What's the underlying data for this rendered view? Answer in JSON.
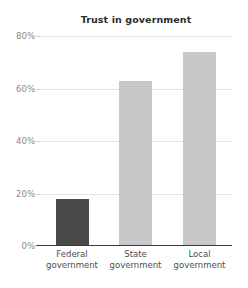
{
  "chart_data": {
    "type": "bar",
    "title": "Trust in government",
    "xlabel": "",
    "ylabel": "",
    "categories": [
      "Federal government",
      "State government",
      "Local government"
    ],
    "category_lines": [
      [
        "Federal",
        "government"
      ],
      [
        "State",
        "government"
      ],
      [
        "Local",
        "government"
      ]
    ],
    "values": [
      18,
      63,
      74
    ],
    "value_labels": [
      "18%",
      "63%",
      "74%"
    ],
    "ylim": [
      0,
      80
    ],
    "yticks": [
      0,
      20,
      40,
      60,
      80
    ],
    "ytick_labels": [
      "0%",
      "20%",
      "40%",
      "60%",
      "80%"
    ],
    "grid": true,
    "legend": "none",
    "bar_colors": [
      "#4a4a4a",
      "#c8c8c8",
      "#c8c8c8"
    ],
    "colors": {
      "background": "#ffffff",
      "title": "#2b2b2b",
      "gridline": "#e3e3e3",
      "axis_line": "#3a3a3a",
      "tick_label": "#8a8a8a",
      "category_label": "#4d4d4d",
      "bar_highlight": "#4a4a4a",
      "bar_default": "#c8c8c8"
    }
  }
}
